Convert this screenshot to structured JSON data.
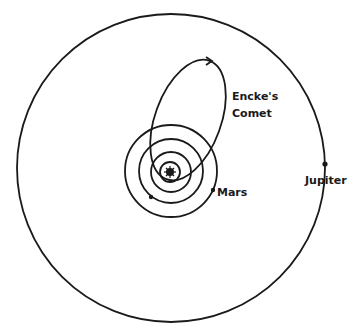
{
  "diagram": {
    "labels": {
      "comet_line1": "Encke's",
      "comet_line2": "Comet",
      "mars": "Mars",
      "jupiter": "Jupiter"
    },
    "bodies": [
      {
        "name": "Sun",
        "symbol": "sun-icon"
      },
      {
        "name": "Mercury"
      },
      {
        "name": "Venus"
      },
      {
        "name": "Earth"
      },
      {
        "name": "Mars"
      },
      {
        "name": "Jupiter"
      },
      {
        "name": "Encke's Comet"
      }
    ],
    "colors": {
      "line": "#1a1a1a",
      "background": "#ffffff"
    }
  }
}
